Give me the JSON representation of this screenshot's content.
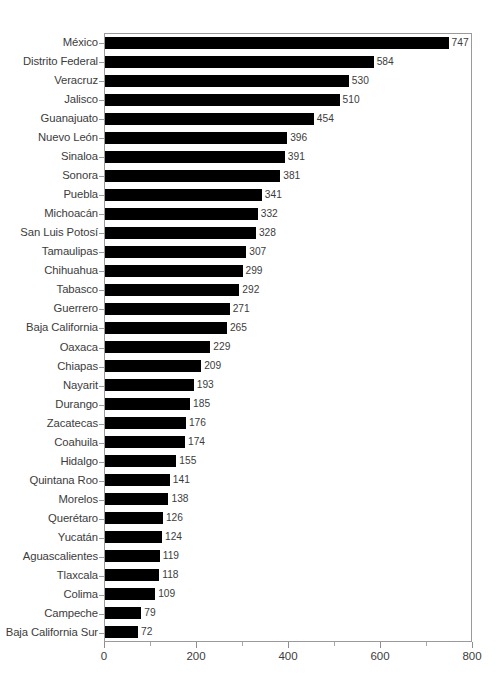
{
  "chart_data": {
    "type": "bar",
    "orientation": "horizontal",
    "title": "",
    "subtitle": "",
    "xlabel": "",
    "ylabel": "",
    "xlim": [
      0,
      800
    ],
    "xticks": [
      0,
      200,
      400,
      600,
      800
    ],
    "xtick_labels": [
      "0",
      "200",
      "400",
      "600",
      "800"
    ],
    "minor_tick_interval": 100,
    "grid": false,
    "legend": null,
    "bar_color": "#000000",
    "axis_color": "#9a9a9a",
    "text_color": "#3c3c3c",
    "show_value_labels": true,
    "categories": [
      "México",
      "Distrito Federal",
      "Veracruz",
      "Jalisco",
      "Guanajuato",
      "Nuevo León",
      "Sinaloa",
      "Sonora",
      "Puebla",
      "Michoacán",
      "San Luis Potosí",
      "Tamaulipas",
      "Chihuahua",
      "Tabasco",
      "Guerrero",
      "Baja California",
      "Oaxaca",
      "Chiapas",
      "Nayarit",
      "Durango",
      "Zacatecas",
      "Coahuila",
      "Hidalgo",
      "Quintana Roo",
      "Morelos",
      "Querétaro",
      "Yucatán",
      "Aguascalientes",
      "Tlaxcala",
      "Colima",
      "Campeche",
      "Baja California Sur"
    ],
    "values": [
      747,
      584,
      530,
      510,
      454,
      396,
      391,
      381,
      341,
      332,
      328,
      307,
      299,
      292,
      271,
      265,
      229,
      209,
      193,
      185,
      176,
      174,
      155,
      141,
      138,
      126,
      124,
      119,
      118,
      109,
      79,
      72
    ],
    "value_labels": [
      "747",
      "584",
      "530",
      "510",
      "454",
      "396",
      "391",
      "381",
      "341",
      "332",
      "328",
      "307",
      "299",
      "292",
      "271",
      "265",
      "229",
      "209",
      "193",
      "185",
      "176",
      "174",
      "155",
      "141",
      "138",
      "126",
      "124",
      "119",
      "118",
      "109",
      "79",
      "72"
    ]
  }
}
